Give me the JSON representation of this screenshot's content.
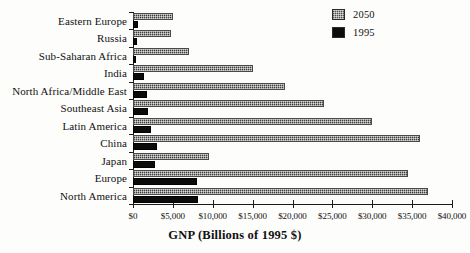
{
  "chart_data": {
    "type": "bar",
    "orientation": "horizontal",
    "title": "",
    "xlabel": "GNP (Billions of 1995 $)",
    "ylabel": "",
    "xlim": [
      0,
      40000
    ],
    "xticks": [
      0,
      5000,
      10000,
      15000,
      20000,
      25000,
      30000,
      35000,
      40000
    ],
    "xtick_labels": [
      "$0",
      "$5,000",
      "$10,000",
      "$15,000",
      "$20,000",
      "$25,000",
      "$30,000",
      "$35,000",
      "$40,000"
    ],
    "grid": false,
    "legend_position": "top-right",
    "categories": [
      "Eastern Europe",
      "Russia",
      "Sub-Saharan Africa",
      "India",
      "North Africa/Middle East",
      "Southeast Asia",
      "Latin America",
      "China",
      "Japan",
      "Europe",
      "North America"
    ],
    "series": [
      {
        "name": "2050",
        "color": "#7c7c7c",
        "values": [
          5000,
          4800,
          7000,
          15000,
          19000,
          24000,
          30000,
          36000,
          9500,
          34500,
          37000
        ]
      },
      {
        "name": "1995",
        "color": "#0b0b0b",
        "values": [
          600,
          500,
          400,
          1400,
          1800,
          1900,
          2300,
          3000,
          2800,
          8000,
          8200
        ]
      }
    ]
  },
  "legend": {
    "entries": [
      {
        "label": "2050",
        "swatch": "hatched-gray"
      },
      {
        "label": "1995",
        "swatch": "solid-black"
      }
    ]
  }
}
